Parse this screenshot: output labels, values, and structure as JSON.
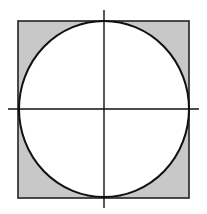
{
  "diagram": {
    "square": {
      "x": 18,
      "y": 21,
      "width": 171,
      "height": 177,
      "fill": "#c8c8c8",
      "stroke": "#222222"
    },
    "circle": {
      "cx": 104,
      "cy": 109,
      "rx": 85,
      "ry": 88,
      "fill": "#ffffff",
      "stroke": "#111111"
    },
    "axes": {
      "horizontal": {
        "x1": 8,
        "x2": 199,
        "y": 109,
        "stroke": "#111111"
      },
      "vertical": {
        "x": 104,
        "y1": 10,
        "y2": 208,
        "stroke": "#111111"
      }
    }
  }
}
